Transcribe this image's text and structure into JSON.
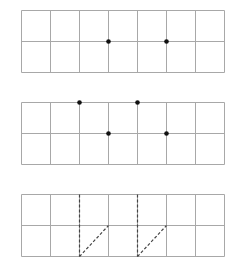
{
  "colors": {
    "background": "#ffffff",
    "grid_line": "#a8a8a8",
    "dot": "#111111",
    "dashed_line": "#444444"
  },
  "grid": {
    "columns": 7,
    "rows": 2,
    "cell_width": 29,
    "cell_height": 31,
    "left": 21
  },
  "panels": [
    {
      "name": "panel-1",
      "top": 10,
      "dots": [
        {
          "col": 3,
          "row": 1
        },
        {
          "col": 5,
          "row": 1
        }
      ],
      "dashed_segments": []
    },
    {
      "name": "panel-2",
      "top": 102,
      "dots": [
        {
          "col": 2,
          "row": 0
        },
        {
          "col": 3,
          "row": 1
        },
        {
          "col": 4,
          "row": 0
        },
        {
          "col": 5,
          "row": 1
        }
      ],
      "dashed_segments": []
    },
    {
      "name": "panel-3",
      "top": 194,
      "dots": [],
      "dashed_segments": [
        {
          "from": {
            "col": 2,
            "row": 0
          },
          "to": {
            "col": 2,
            "row": 2
          }
        },
        {
          "from": {
            "col": 2,
            "row": 2
          },
          "to": {
            "col": 3,
            "row": 1
          }
        },
        {
          "from": {
            "col": 4,
            "row": 0
          },
          "to": {
            "col": 4,
            "row": 2
          }
        },
        {
          "from": {
            "col": 4,
            "row": 2
          },
          "to": {
            "col": 5,
            "row": 1
          }
        }
      ]
    }
  ]
}
